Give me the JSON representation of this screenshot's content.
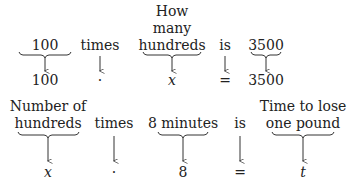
{
  "row1": {
    "top": [
      {
        "lines": [
          "100"
        ],
        "x": 45
      },
      {
        "lines": [
          "times"
        ],
        "x": 100
      },
      {
        "lines": [
          "How",
          "many",
          "hundreds"
        ],
        "x": 172
      },
      {
        "lines": [
          "is"
        ],
        "x": 225
      },
      {
        "lines": [
          "3500"
        ],
        "x": 266
      }
    ],
    "bottom": [
      {
        "text": "100",
        "x": 45
      },
      {
        "text": "·",
        "x": 100
      },
      {
        "text": "x",
        "x": 172,
        "italic": true
      },
      {
        "text": "=",
        "x": 225
      },
      {
        "text": "3500",
        "x": 266
      }
    ]
  },
  "row2": {
    "top": [
      {
        "lines": [
          "Number of",
          "hundreds"
        ],
        "x": 48
      },
      {
        "lines": [
          "times"
        ],
        "x": 114
      },
      {
        "lines": [
          "8 minutes"
        ],
        "x": 183
      },
      {
        "lines": [
          "is"
        ],
        "x": 240
      },
      {
        "lines": [
          "Time to lose",
          "one pound"
        ],
        "x": 303
      }
    ],
    "bottom": [
      {
        "text": "x",
        "x": 48,
        "italic": true
      },
      {
        "text": "·",
        "x": 114
      },
      {
        "text": "8",
        "x": 183
      },
      {
        "text": "=",
        "x": 240
      },
      {
        "text": "t",
        "x": 303,
        "italic": true
      }
    ]
  }
}
